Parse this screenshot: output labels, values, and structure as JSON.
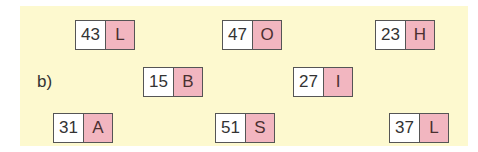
{
  "section_label": "b)",
  "colors": {
    "panel": "#fdf9cf",
    "number_cell": "#ffffff",
    "letter_cell": "#f2b6c0",
    "border": "#555555"
  },
  "cards": [
    {
      "number": "43",
      "letter": "L",
      "x": 75,
      "y": 20
    },
    {
      "number": "47",
      "letter": "O",
      "x": 222,
      "y": 20
    },
    {
      "number": "23",
      "letter": "H",
      "x": 375,
      "y": 20
    },
    {
      "number": "15",
      "letter": "B",
      "x": 143,
      "y": 67
    },
    {
      "number": "27",
      "letter": "I",
      "x": 293,
      "y": 67
    },
    {
      "number": "31",
      "letter": "A",
      "x": 53,
      "y": 113
    },
    {
      "number": "51",
      "letter": "S",
      "x": 215,
      "y": 113
    },
    {
      "number": "37",
      "letter": "L",
      "x": 389,
      "y": 113
    }
  ]
}
